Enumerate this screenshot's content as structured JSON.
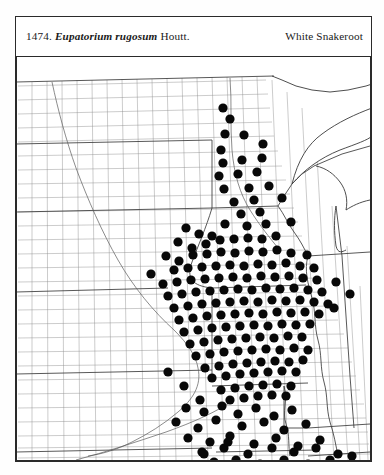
{
  "plate": {
    "number": "1474.",
    "scientific_name": "Eupatorium rugosum",
    "authority": "Houtt.",
    "common_name": "White Snakeroot"
  },
  "map": {
    "type": "county-level-distribution-map",
    "region": "North Central United States",
    "projection_width": 355,
    "projection_height": 405,
    "colors": {
      "dot": "#080808",
      "county_border": "#8c8c8c",
      "state_border": "#3a3a3a",
      "frame": "#2a2a2a",
      "background": "#ffffff"
    },
    "symbol": {
      "shape": "filled-circle",
      "radius_px": 4.6,
      "meaning": "county record of occurrence"
    },
    "states_shown": [
      "North Dakota",
      "South Dakota",
      "Nebraska",
      "Kansas",
      "Oklahoma",
      "Minnesota",
      "Iowa",
      "Missouri",
      "Arkansas",
      "Wisconsin",
      "Illinois",
      "Michigan",
      "Kentucky",
      "Tennessee"
    ],
    "occurrences": [
      [
        207,
        52
      ],
      [
        214,
        63
      ],
      [
        209,
        78
      ],
      [
        228,
        79
      ],
      [
        205,
        94
      ],
      [
        247,
        88
      ],
      [
        207,
        107
      ],
      [
        226,
        104
      ],
      [
        246,
        102
      ],
      [
        203,
        120
      ],
      [
        222,
        118
      ],
      [
        241,
        116
      ],
      [
        208,
        133
      ],
      [
        233,
        132
      ],
      [
        253,
        130
      ],
      [
        218,
        146
      ],
      [
        238,
        144
      ],
      [
        266,
        142
      ],
      [
        225,
        158
      ],
      [
        244,
        156
      ],
      [
        209,
        168
      ],
      [
        231,
        170
      ],
      [
        250,
        168
      ],
      [
        275,
        166
      ],
      [
        170,
        172
      ],
      [
        183,
        178
      ],
      [
        196,
        180
      ],
      [
        162,
        186
      ],
      [
        176,
        192
      ],
      [
        190,
        188
      ],
      [
        204,
        184
      ],
      [
        218,
        183
      ],
      [
        232,
        182
      ],
      [
        246,
        183
      ],
      [
        260,
        180
      ],
      [
        150,
        200
      ],
      [
        163,
        205
      ],
      [
        177,
        199
      ],
      [
        191,
        198
      ],
      [
        205,
        196
      ],
      [
        219,
        197
      ],
      [
        233,
        195
      ],
      [
        247,
        196
      ],
      [
        261,
        194
      ],
      [
        275,
        197
      ],
      [
        291,
        199
      ],
      [
        135,
        218
      ],
      [
        158,
        214
      ],
      [
        172,
        212
      ],
      [
        186,
        211
      ],
      [
        200,
        210
      ],
      [
        214,
        209
      ],
      [
        228,
        210
      ],
      [
        242,
        208
      ],
      [
        256,
        209
      ],
      [
        270,
        207
      ],
      [
        284,
        210
      ],
      [
        298,
        212
      ],
      [
        147,
        228
      ],
      [
        161,
        226
      ],
      [
        175,
        224
      ],
      [
        189,
        223
      ],
      [
        203,
        222
      ],
      [
        217,
        221
      ],
      [
        231,
        222
      ],
      [
        245,
        220
      ],
      [
        259,
        221
      ],
      [
        273,
        220
      ],
      [
        287,
        222
      ],
      [
        301,
        224
      ],
      [
        152,
        240
      ],
      [
        166,
        238
      ],
      [
        180,
        236
      ],
      [
        194,
        235
      ],
      [
        208,
        234
      ],
      [
        222,
        233
      ],
      [
        236,
        234
      ],
      [
        250,
        232
      ],
      [
        264,
        233
      ],
      [
        278,
        232
      ],
      [
        292,
        234
      ],
      [
        306,
        236
      ],
      [
        158,
        252
      ],
      [
        172,
        250
      ],
      [
        186,
        248
      ],
      [
        200,
        247
      ],
      [
        214,
        246
      ],
      [
        228,
        245
      ],
      [
        242,
        246
      ],
      [
        256,
        244
      ],
      [
        270,
        245
      ],
      [
        284,
        244
      ],
      [
        298,
        246
      ],
      [
        312,
        248
      ],
      [
        163,
        264
      ],
      [
        177,
        262
      ],
      [
        191,
        260
      ],
      [
        205,
        259
      ],
      [
        219,
        258
      ],
      [
        233,
        257
      ],
      [
        247,
        258
      ],
      [
        261,
        256
      ],
      [
        275,
        257
      ],
      [
        289,
        256
      ],
      [
        303,
        258
      ],
      [
        168,
        276
      ],
      [
        182,
        274
      ],
      [
        196,
        272
      ],
      [
        210,
        271
      ],
      [
        224,
        270
      ],
      [
        238,
        269
      ],
      [
        252,
        270
      ],
      [
        266,
        268
      ],
      [
        280,
        269
      ],
      [
        294,
        268
      ],
      [
        174,
        288
      ],
      [
        188,
        286
      ],
      [
        202,
        284
      ],
      [
        216,
        283
      ],
      [
        230,
        282
      ],
      [
        244,
        281
      ],
      [
        258,
        282
      ],
      [
        272,
        280
      ],
      [
        286,
        281
      ],
      [
        180,
        300
      ],
      [
        194,
        298
      ],
      [
        208,
        296
      ],
      [
        222,
        295
      ],
      [
        236,
        294
      ],
      [
        250,
        293
      ],
      [
        264,
        294
      ],
      [
        278,
        292
      ],
      [
        292,
        294
      ],
      [
        189,
        312
      ],
      [
        203,
        310
      ],
      [
        217,
        308
      ],
      [
        231,
        307
      ],
      [
        245,
        306
      ],
      [
        259,
        305
      ],
      [
        273,
        306
      ],
      [
        287,
        304
      ],
      [
        196,
        322
      ],
      [
        210,
        320
      ],
      [
        224,
        318
      ],
      [
        238,
        317
      ],
      [
        252,
        316
      ],
      [
        266,
        315
      ],
      [
        280,
        316
      ],
      [
        205,
        334
      ],
      [
        219,
        332
      ],
      [
        233,
        330
      ],
      [
        247,
        329
      ],
      [
        261,
        328
      ],
      [
        275,
        330
      ],
      [
        214,
        344
      ],
      [
        228,
        342
      ],
      [
        242,
        340
      ],
      [
        256,
        339
      ],
      [
        270,
        340
      ],
      [
        152,
        316
      ],
      [
        168,
        330
      ],
      [
        184,
        344
      ],
      [
        320,
        226
      ],
      [
        334,
        238
      ],
      [
        318,
        252
      ],
      [
        170,
        352
      ],
      [
        188,
        356
      ],
      [
        206,
        350
      ],
      [
        222,
        358
      ],
      [
        240,
        352
      ],
      [
        258,
        360
      ],
      [
        276,
        354
      ],
      [
        160,
        366
      ],
      [
        182,
        372
      ],
      [
        200,
        364
      ],
      [
        226,
        370
      ],
      [
        248,
        366
      ],
      [
        268,
        374
      ],
      [
        290,
        368
      ],
      [
        172,
        382
      ],
      [
        194,
        386
      ],
      [
        214,
        380
      ],
      [
        238,
        388
      ],
      [
        260,
        382
      ],
      [
        282,
        390
      ],
      [
        304,
        384
      ],
      [
        186,
        396
      ],
      [
        208,
        392
      ],
      [
        232,
        398
      ],
      [
        256,
        392
      ],
      [
        278,
        396
      ],
      [
        300,
        392
      ],
      [
        322,
        398
      ],
      [
        198,
        406
      ],
      [
        220,
        404
      ],
      [
        244,
        408
      ],
      [
        268,
        404
      ],
      [
        292,
        408
      ],
      [
        314,
        404
      ],
      [
        336,
        400
      ],
      [
        212,
        386
      ],
      [
        188,
        398
      ]
    ],
    "occurrence_count_note": "dense filled coverage across Missouri, Iowa, Illinois and Arkansas"
  }
}
